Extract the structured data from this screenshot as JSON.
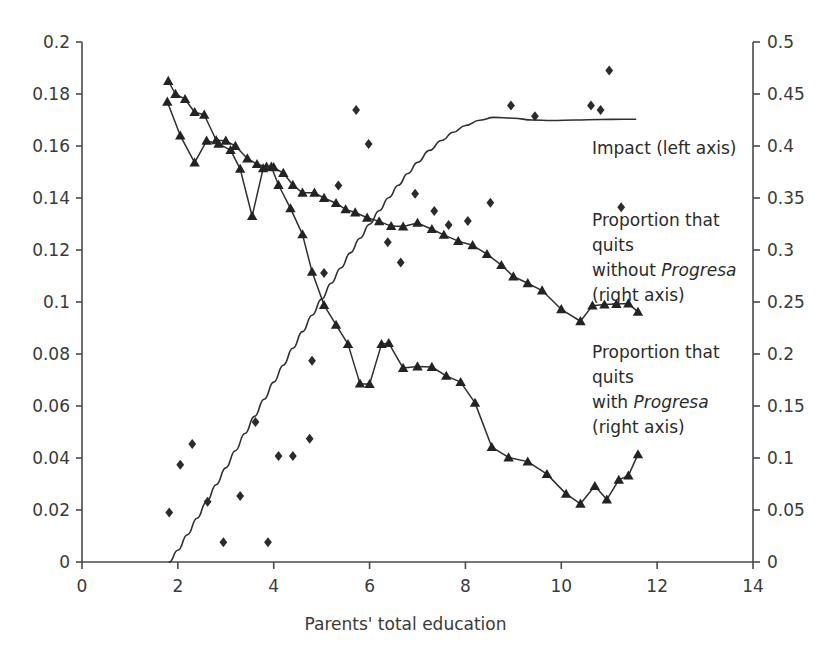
{
  "chart_data": {
    "type": "scatter",
    "title": "",
    "subtitle": "",
    "xlabel": "Parents' total education",
    "ylabel_left": "",
    "ylabel_right": "",
    "xlim": [
      0,
      14
    ],
    "ylim_left": [
      0,
      0.2
    ],
    "ylim_right": [
      0,
      0.5
    ],
    "grid": false,
    "legend_position": "inside-right-annotations",
    "x_ticks": [
      0,
      2,
      4,
      6,
      8,
      10,
      12,
      14
    ],
    "x_tick_labels": [
      "0",
      "2",
      "4",
      "6",
      "8",
      "10",
      "12",
      "14"
    ],
    "y_ticks_left": [
      0,
      0.02,
      0.04,
      0.06,
      0.08,
      0.1,
      0.12,
      0.14,
      0.16,
      0.18,
      0.2
    ],
    "y_tick_labels_left": [
      "0",
      "0.02",
      "0.04",
      "0.06",
      "0.08",
      "0.1",
      "0.12",
      "0.14",
      "0.16",
      "0.18",
      "0.2"
    ],
    "y_ticks_right": [
      0,
      0.05,
      0.1,
      0.15,
      0.2,
      0.25,
      0.3,
      0.35,
      0.4,
      0.45,
      0.5
    ],
    "y_tick_labels_right": [
      "0",
      "0.05",
      "0.1",
      "0.15",
      "0.2",
      "0.25",
      "0.3",
      "0.35",
      "0.4",
      "0.45",
      "0.5"
    ],
    "series": [
      {
        "name": "Impact (left axis)",
        "axis": "left",
        "style": "smooth-curve",
        "marker": "none",
        "points": [
          [
            1.82,
            0.0
          ],
          [
            2.0,
            0.0045
          ],
          [
            2.2,
            0.0105
          ],
          [
            2.4,
            0.0168
          ],
          [
            2.6,
            0.0232
          ],
          [
            2.8,
            0.0297
          ],
          [
            3.0,
            0.0362
          ],
          [
            3.2,
            0.0428
          ],
          [
            3.4,
            0.0494
          ],
          [
            3.6,
            0.056
          ],
          [
            3.8,
            0.0626
          ],
          [
            4.0,
            0.0692
          ],
          [
            4.2,
            0.0757
          ],
          [
            4.4,
            0.0822
          ],
          [
            4.6,
            0.0886
          ],
          [
            4.8,
            0.0949
          ],
          [
            5.0,
            0.1011
          ],
          [
            5.2,
            0.1072
          ],
          [
            5.4,
            0.1131
          ],
          [
            5.6,
            0.1189
          ],
          [
            5.8,
            0.1245
          ],
          [
            6.0,
            0.1299
          ],
          [
            6.2,
            0.1351
          ],
          [
            6.4,
            0.1401
          ],
          [
            6.6,
            0.1449
          ],
          [
            6.8,
            0.1494
          ],
          [
            7.0,
            0.1537
          ],
          [
            7.25,
            0.1583
          ],
          [
            7.5,
            0.1621
          ],
          [
            7.75,
            0.1653
          ],
          [
            8.0,
            0.1679
          ],
          [
            8.3,
            0.1699
          ],
          [
            8.6,
            0.171
          ],
          [
            9.0,
            0.1707
          ],
          [
            9.4,
            0.17
          ],
          [
            9.8,
            0.1698
          ],
          [
            10.3,
            0.17
          ],
          [
            10.8,
            0.1702
          ],
          [
            11.3,
            0.1703
          ],
          [
            11.55,
            0.1703
          ]
        ]
      },
      {
        "name": "Proportion that quits without Progresa (right axis)",
        "axis": "right",
        "style": "line-markers",
        "marker": "triangle",
        "points": [
          [
            1.8,
            0.4625
          ],
          [
            1.95,
            0.45
          ],
          [
            2.15,
            0.445
          ],
          [
            2.35,
            0.4325
          ],
          [
            2.55,
            0.43
          ],
          [
            2.8,
            0.4055
          ],
          [
            3.0,
            0.405
          ],
          [
            3.2,
            0.4
          ],
          [
            3.45,
            0.388
          ],
          [
            3.65,
            0.3825
          ],
          [
            3.85,
            0.38
          ],
          [
            4.0,
            0.3795
          ],
          [
            4.2,
            0.374
          ],
          [
            4.4,
            0.3625
          ],
          [
            4.6,
            0.355
          ],
          [
            4.85,
            0.355
          ],
          [
            5.05,
            0.35
          ],
          [
            5.3,
            0.345
          ],
          [
            5.5,
            0.339
          ],
          [
            5.7,
            0.336
          ],
          [
            5.95,
            0.331
          ],
          [
            6.2,
            0.3275
          ],
          [
            6.45,
            0.323
          ],
          [
            6.7,
            0.3225
          ],
          [
            7.0,
            0.326
          ],
          [
            7.3,
            0.32
          ],
          [
            7.55,
            0.3145
          ],
          [
            7.85,
            0.3085
          ],
          [
            8.15,
            0.3045
          ],
          [
            8.45,
            0.296
          ],
          [
            8.75,
            0.2855
          ],
          [
            9.0,
            0.2745
          ],
          [
            9.3,
            0.268
          ],
          [
            9.6,
            0.261
          ],
          [
            10.0,
            0.243
          ],
          [
            10.4,
            0.2315
          ],
          [
            10.65,
            0.2465
          ],
          [
            10.9,
            0.2475
          ],
          [
            11.15,
            0.248
          ],
          [
            11.4,
            0.2485
          ],
          [
            11.6,
            0.2405
          ]
        ]
      },
      {
        "name": "Proportion that quits with Progresa (right axis)",
        "axis": "right",
        "style": "line-markers",
        "marker": "triangle",
        "points": [
          [
            1.78,
            0.4425
          ],
          [
            2.05,
            0.41
          ],
          [
            2.35,
            0.384
          ],
          [
            2.6,
            0.405
          ],
          [
            2.85,
            0.402
          ],
          [
            3.1,
            0.396
          ],
          [
            3.3,
            0.378
          ],
          [
            3.55,
            0.3325
          ],
          [
            3.78,
            0.3785
          ],
          [
            3.95,
            0.38
          ],
          [
            4.1,
            0.3625
          ],
          [
            4.35,
            0.34
          ],
          [
            4.6,
            0.315
          ],
          [
            4.8,
            0.279
          ],
          [
            5.05,
            0.247
          ],
          [
            5.3,
            0.228
          ],
          [
            5.55,
            0.2095
          ],
          [
            5.8,
            0.1715
          ],
          [
            6.0,
            0.171
          ],
          [
            6.25,
            0.2095
          ],
          [
            6.4,
            0.2105
          ],
          [
            6.7,
            0.1865
          ],
          [
            7.0,
            0.188
          ],
          [
            7.3,
            0.1875
          ],
          [
            7.6,
            0.179
          ],
          [
            7.9,
            0.173
          ],
          [
            8.2,
            0.153
          ],
          [
            8.55,
            0.1105
          ],
          [
            8.9,
            0.1005
          ],
          [
            9.3,
            0.0965
          ],
          [
            9.7,
            0.0845
          ],
          [
            10.1,
            0.0655
          ],
          [
            10.4,
            0.056
          ],
          [
            10.7,
            0.073
          ],
          [
            10.95,
            0.06
          ],
          [
            11.2,
            0.079
          ],
          [
            11.4,
            0.083
          ],
          [
            11.6,
            0.1035
          ]
        ]
      },
      {
        "name": "Proportion that quits without Progresa scatter (right axis)",
        "axis": "right",
        "style": "scatter",
        "marker": "diamond",
        "points": [
          [
            1.82,
            0.0475
          ],
          [
            2.05,
            0.0935
          ],
          [
            2.3,
            0.1135
          ],
          [
            2.62,
            0.058
          ],
          [
            2.95,
            0.019
          ],
          [
            3.3,
            0.0635
          ],
          [
            3.62,
            0.1345
          ],
          [
            3.88,
            0.019
          ],
          [
            4.1,
            0.102
          ],
          [
            4.4,
            0.102
          ],
          [
            4.75,
            0.1185
          ],
          [
            4.8,
            0.1935
          ],
          [
            5.05,
            0.278
          ],
          [
            5.35,
            0.362
          ],
          [
            5.72,
            0.4345
          ],
          [
            5.98,
            0.402
          ],
          [
            6.38,
            0.3075
          ],
          [
            6.65,
            0.288
          ],
          [
            6.95,
            0.354
          ],
          [
            7.35,
            0.3375
          ],
          [
            7.65,
            0.324
          ],
          [
            8.05,
            0.328
          ],
          [
            8.52,
            0.3455
          ],
          [
            8.95,
            0.439
          ],
          [
            9.45,
            0.4285
          ],
          [
            10.62,
            0.439
          ],
          [
            10.82,
            0.4345
          ],
          [
            11.0,
            0.4725
          ],
          [
            11.25,
            0.341
          ]
        ]
      }
    ],
    "annotations": [
      {
        "id": "impact-annotation",
        "lines": [
          {
            "text": "Impact (left axis)",
            "italic_part": ""
          }
        ]
      },
      {
        "id": "without-progresa-annotation",
        "lines": [
          {
            "text": "Proportion that",
            "italic_part": ""
          },
          {
            "text": "quits",
            "italic_part": ""
          },
          {
            "text": "without ",
            "italic_part": "Progresa"
          },
          {
            "text": "(right axis)",
            "italic_part": ""
          }
        ]
      },
      {
        "id": "with-progresa-annotation",
        "lines": [
          {
            "text": "Proportion that",
            "italic_part": ""
          },
          {
            "text": "quits",
            "italic_part": ""
          },
          {
            "text": "with ",
            "italic_part": "Progresa"
          },
          {
            "text": "(right axis)",
            "italic_part": ""
          }
        ]
      }
    ]
  },
  "colors": {
    "background": "#ffffff",
    "axis": "#4a4a4a",
    "ink": "#2b2b2b",
    "marker": "#232323"
  },
  "annot": {
    "impact": "Impact (left axis)",
    "without_l1": "Proportion that",
    "without_l2": "quits",
    "without_l3a": "without ",
    "without_l3b": "Progresa",
    "without_l4": "(right axis)",
    "with_l1": "Proportion that",
    "with_l2": "quits",
    "with_l3a": "with ",
    "with_l3b": "Progresa",
    "with_l4": "(right axis)"
  },
  "axis_title": {
    "x": "Parents' total education"
  }
}
